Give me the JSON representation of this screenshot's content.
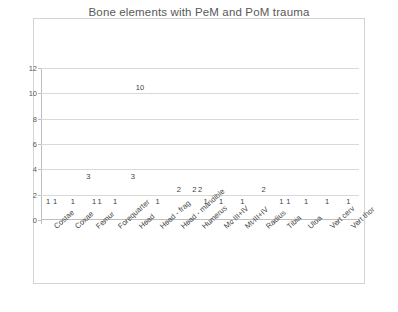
{
  "chart": {
    "title": "Bone elements with PeM and PoM trauma",
    "legend_position": "top"
  },
  "legend": [
    {
      "label": "Bos",
      "color": "#7f7f7f"
    },
    {
      "label": "Equus",
      "color": "#a6a6a6"
    },
    {
      "label": "Homo",
      "color": "#bfbfbf"
    },
    {
      "label": "O/C",
      "color": "#d9d9d9"
    },
    {
      "label": "Sus",
      "color": "#8c8c8c"
    }
  ],
  "yaxis": {
    "ticks": [
      "0",
      "2",
      "4",
      "6",
      "8",
      "10",
      "12"
    ]
  },
  "chart_data": {
    "type": "bar",
    "title": "Bone elements with PeM and PoM trauma",
    "xlabel": "",
    "ylabel": "",
    "ylim": [
      0,
      12
    ],
    "ytick_step": 2,
    "grid": true,
    "legend": [
      "Bos",
      "Equus",
      "Homo",
      "O/C",
      "Sus"
    ],
    "categories": [
      "Costae",
      "Coxae",
      "Femur",
      "Forequarter",
      "Head",
      "Head - frag",
      "Head - mandible",
      "Humerus",
      "Mc III+IV",
      "Mt III+IV",
      "Radius",
      "Tibia",
      "Ulna",
      "Vert cerv",
      "Vert thor"
    ],
    "series": [
      {
        "name": "Bos",
        "values": [
          1,
          1,
          3,
          1,
          0,
          1,
          2,
          2,
          0,
          0,
          2,
          1,
          1,
          1,
          1
        ]
      },
      {
        "name": "Equus",
        "values": [
          0,
          0,
          1,
          0,
          3,
          0,
          0,
          2,
          1,
          0,
          0,
          0,
          0,
          0,
          0
        ]
      },
      {
        "name": "Homo",
        "values": [
          1,
          0,
          0,
          0,
          0,
          0,
          0,
          0,
          0,
          0,
          0,
          0,
          0,
          0,
          0
        ]
      },
      {
        "name": "O/C",
        "values": [
          0,
          0,
          1,
          0,
          0,
          0,
          0,
          1,
          0,
          1,
          0,
          1,
          0,
          0,
          0
        ]
      },
      {
        "name": "Sus",
        "values": [
          0,
          0,
          0,
          0,
          10,
          0,
          0,
          0,
          0,
          0,
          0,
          0,
          0,
          0,
          0
        ]
      }
    ],
    "data_labels": [
      "1",
      "1",
      "1",
      "3",
      "1",
      "1",
      "1",
      "3",
      "10",
      "1",
      "2",
      "2",
      "2",
      "1",
      "1",
      "1",
      "2",
      "1",
      "1",
      "1",
      "1",
      "1"
    ]
  }
}
